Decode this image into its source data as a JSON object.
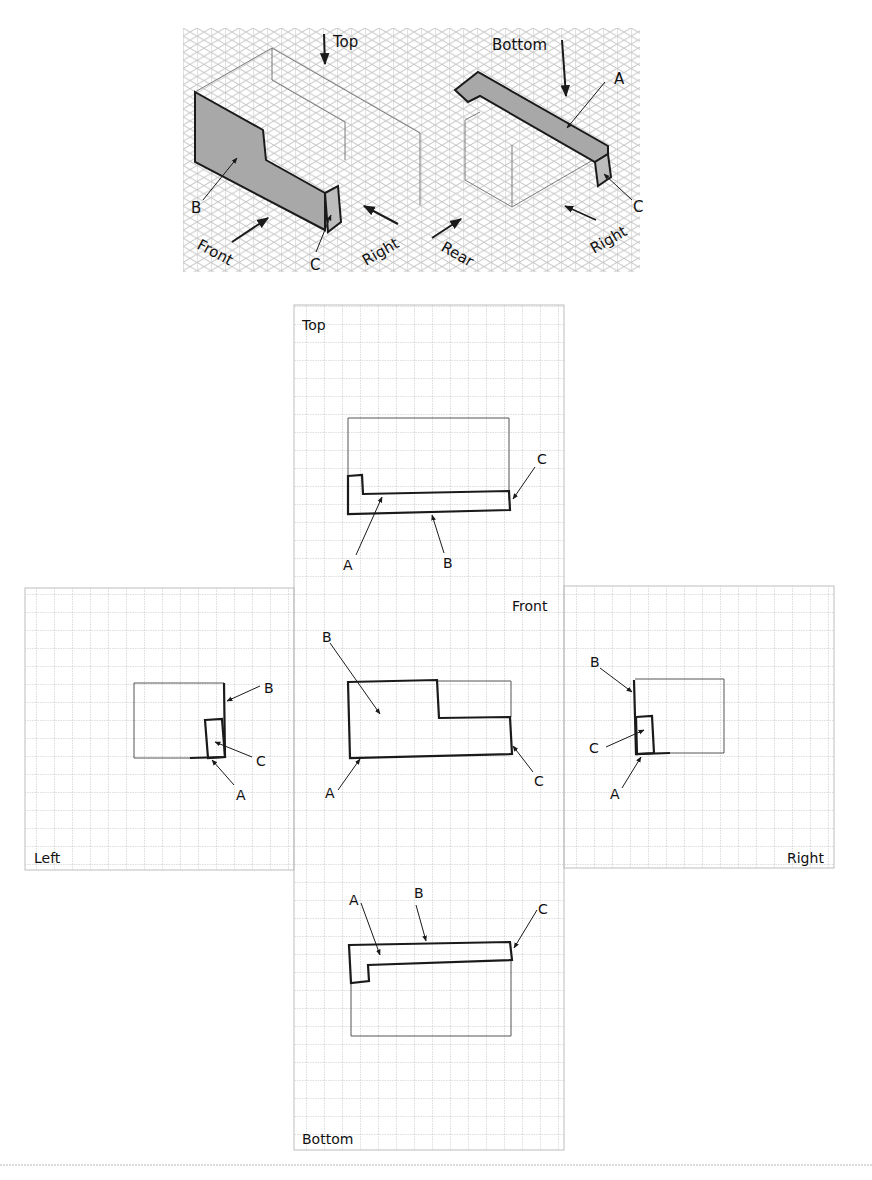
{
  "figure": {
    "isometric_view": {
      "direction_labels": {
        "top": "Top",
        "bottom": "Bottom",
        "front": "Front",
        "right_1": "Right",
        "rear": "Rear",
        "right_2": "Right"
      },
      "part_labels": {
        "left_b": "B",
        "left_c": "C",
        "right_a": "A",
        "right_c": "C"
      }
    },
    "orthographic_views": {
      "top": {
        "title": "Top",
        "labels": {
          "a": "A",
          "b": "B",
          "c": "C"
        }
      },
      "front": {
        "title": "Front",
        "labels": {
          "a": "A",
          "b": "B",
          "c": "C"
        }
      },
      "left": {
        "title": "Left",
        "labels": {
          "a": "A",
          "b": "B",
          "c": "C"
        }
      },
      "right": {
        "title": "Right",
        "labels": {
          "a": "A",
          "b": "B",
          "c": "C"
        }
      },
      "bottom": {
        "title": "Bottom",
        "labels": {
          "a": "A",
          "b": "B",
          "c": "C"
        }
      }
    },
    "colors": {
      "grid": "#b8b8b8",
      "ink": "#1a1a1a",
      "shade": "#a8a8a8"
    }
  }
}
